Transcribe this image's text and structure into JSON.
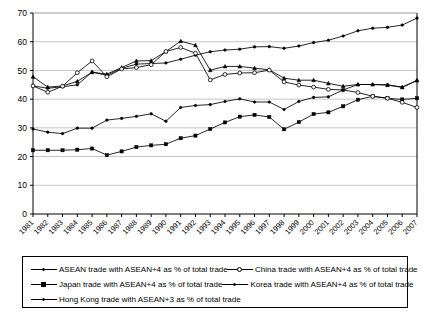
{
  "chart_data": {
    "type": "line",
    "title": "",
    "xlabel": "",
    "ylabel": "",
    "ylim": [
      0,
      70
    ],
    "yticks": [
      0,
      10,
      20,
      30,
      40,
      50,
      60,
      70
    ],
    "grid": true,
    "legend_position": "bottom",
    "categories": [
      "1981",
      "1982",
      "1983",
      "1984",
      "1985",
      "1986",
      "1987",
      "1988",
      "1989",
      "1990",
      "1991",
      "1992",
      "1993",
      "1994",
      "1995",
      "1996",
      "1997",
      "1998",
      "1999",
      "2000",
      "2001",
      "2002",
      "2003",
      "2004",
      "2005",
      "2006",
      "2007"
    ],
    "series": [
      {
        "name": "ASEAN trade with ASEAN+4 as % of total trade",
        "marker": "plus-filled",
        "values": [
          44.6,
          43.8,
          44.3,
          45.0,
          49.4,
          48.3,
          50.7,
          52.2,
          52.4,
          52.6,
          53.9,
          55.3,
          56.5,
          57.1,
          57.4,
          58.2,
          58.3,
          57.7,
          58.5,
          59.7,
          60.5,
          62.0,
          63.8,
          64.7,
          65.0,
          65.8,
          68.2
        ]
      },
      {
        "name": "Japan trade with ASEAN+4 as % of total trade",
        "marker": "square-filled",
        "values": [
          22.2,
          22.2,
          22.2,
          22.4,
          22.8,
          20.5,
          21.8,
          23.3,
          23.9,
          24.3,
          26.4,
          27.3,
          29.6,
          31.9,
          33.9,
          34.5,
          33.8,
          29.5,
          32.0,
          34.8,
          35.4,
          37.5,
          39.8,
          41.0,
          40.3,
          39.9,
          40.3
        ]
      },
      {
        "name": "Hong Kong trade with ASEAN+3 as % of total trade",
        "marker": "triangle-filled",
        "values": [
          47.8,
          44.2,
          44.6,
          46.2,
          49.4,
          48.7,
          51.0,
          53.3,
          53.4,
          56.6,
          60.2,
          58.8,
          50.1,
          51.4,
          51.4,
          50.8,
          50.2,
          47.3,
          46.6,
          46.6,
          45.5,
          44.5,
          45.1,
          45.1,
          44.9,
          44.1,
          46.5
        ]
      },
      {
        "name": "China trade with ASEAN+4 as % of total trade",
        "marker": "circle-hollow",
        "values": [
          44.6,
          42.4,
          44.5,
          49.2,
          53.3,
          47.8,
          50.5,
          51.0,
          52.0,
          56.6,
          58.0,
          56.0,
          46.7,
          48.6,
          49.1,
          49.2,
          50.1,
          46.0,
          44.9,
          44.2,
          43.4,
          43.2,
          42.3,
          41.0,
          40.3,
          38.9,
          37.1
        ]
      },
      {
        "name": "Korea trade with ASEAN+4 as % of total trade",
        "marker": "dot-filled",
        "values": [
          29.6,
          28.5,
          28.0,
          29.9,
          29.9,
          32.7,
          33.3,
          34.0,
          34.9,
          32.3,
          37.1,
          37.8,
          38.1,
          39.2,
          40.1,
          39.0,
          39.0,
          36.4,
          39.2,
          40.6,
          40.8,
          43.2,
          45.1,
          45.1,
          45.0,
          44.2,
          46.5
        ]
      }
    ]
  },
  "legend": {
    "items": [
      {
        "label": "ASEAN trade with ASEAN+4 as % of total trade",
        "marker": "plus-filled"
      },
      {
        "label": "China trade with ASEAN+4 as % of total trade",
        "marker": "circle-hollow"
      },
      {
        "label": "Japan trade with ASEAN+4 as % of total trade",
        "marker": "square-filled"
      },
      {
        "label": "Korea trade with ASEAN+4 as % of total trade",
        "marker": "dot-filled"
      },
      {
        "label": "Hong Kong trade with ASEAN+3 as % of total trade",
        "marker": "triangle-filled"
      }
    ]
  }
}
